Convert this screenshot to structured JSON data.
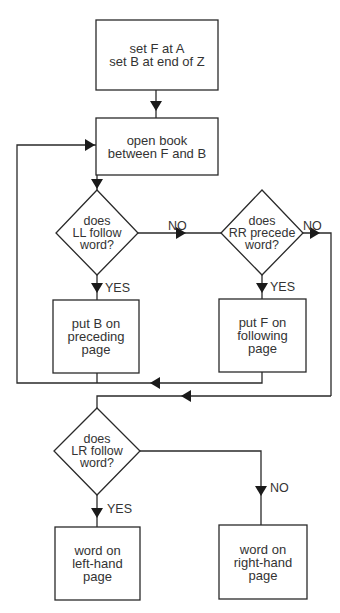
{
  "diagram": {
    "type": "flowchart",
    "nodes": {
      "start": {
        "text": "set F at A\nset B at end of Z"
      },
      "open": {
        "text": "open book\nbetween F and B"
      },
      "q_ll": {
        "text": "does\nLL follow\nword?"
      },
      "q_rr": {
        "text": "does\nRR precede\nword?"
      },
      "put_b": {
        "text": "put B on\npreceding\npage"
      },
      "put_f": {
        "text": "put F on\nfollowing\npage"
      },
      "q_lr": {
        "text": "does\nLR follow\nword?"
      },
      "left": {
        "text": "word on\nleft-hand\npage"
      },
      "right": {
        "text": "word on\nright-hand\npage"
      }
    },
    "edge_labels": {
      "ll_no": "NO",
      "ll_yes": "YES",
      "rr_no": "NO",
      "rr_yes": "YES",
      "lr_yes": "YES",
      "lr_no": "NO"
    },
    "edges": [
      {
        "from": "start",
        "to": "open"
      },
      {
        "from": "open",
        "to": "q_ll"
      },
      {
        "from": "q_ll",
        "to": "put_b",
        "label": "YES"
      },
      {
        "from": "q_ll",
        "to": "q_rr",
        "label": "NO"
      },
      {
        "from": "q_rr",
        "to": "put_f",
        "label": "YES"
      },
      {
        "from": "q_rr",
        "to": "q_lr",
        "label": "NO"
      },
      {
        "from": "put_b",
        "to": "open"
      },
      {
        "from": "put_f",
        "to": "open"
      },
      {
        "from": "q_lr",
        "to": "left",
        "label": "YES"
      },
      {
        "from": "q_lr",
        "to": "right",
        "label": "NO"
      }
    ]
  }
}
